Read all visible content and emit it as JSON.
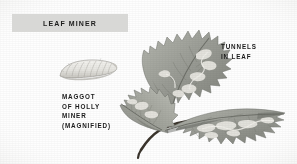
{
  "plate": {
    "title_banner": {
      "label": "LEAF  MINER",
      "background_color": "#d8d8d6",
      "text_color": "#1d1d1d"
    },
    "background_color": "#ffffff"
  },
  "captions": {
    "maggot": {
      "line1": "MAGGOT",
      "line2": "OF  HOLLY",
      "line3": "MINER",
      "line4": "(MAGNIFIED)"
    },
    "tunnels": {
      "line1": "TUNNELS",
      "line2": "IN  LEAF"
    }
  },
  "illustrations": {
    "maggot": {
      "name": "maggot-of-holly-miner",
      "body_color": "#e9e8e4",
      "outline_color": "#8d8b86",
      "segment_color": "#b9b7b1"
    },
    "holly_sprig": {
      "name": "holly-leaf-sprig-with-mines",
      "leaf_color": "#9a9c95",
      "leaf_shadow_color": "#74766f",
      "leaf_highlight_color": "#b9bbb3",
      "vein_color": "#6d6f68",
      "mine_color": "#e4e3dd",
      "stem_color": "#3a342c",
      "leaf_count": 3
    }
  }
}
